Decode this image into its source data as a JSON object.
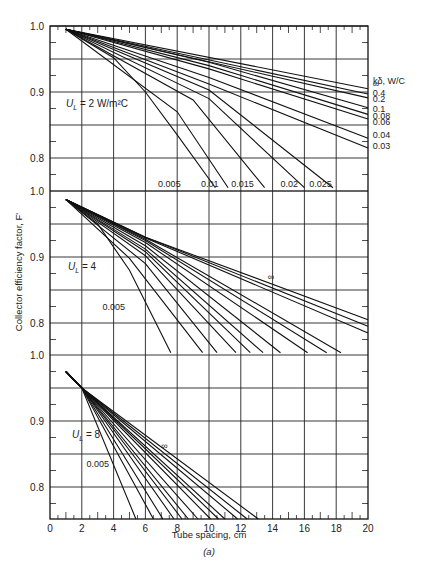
{
  "chart_data": {
    "type": "line",
    "title": "",
    "caption": "(a)",
    "xlabel": "Tube spacing, cm",
    "ylabel": "Collector efficiency factor, F'",
    "xlim": [
      0,
      20
    ],
    "xticks": [
      0,
      2,
      4,
      6,
      8,
      10,
      12,
      14,
      16,
      18,
      20
    ],
    "grid": true,
    "legend_title": "kδ, W/C",
    "legend_placement": "right of top panel",
    "panels": [
      {
        "label": "U_L = 2 W/m²C",
        "label_main": "U",
        "label_sub": "L",
        "label_rest": " = 2 W/m²C",
        "ylim": [
          0.75,
          1.0
        ],
        "yticks": [
          1.0,
          0.9,
          0.8
        ],
        "ytick_labels": [
          "1.0",
          "0.9",
          "0.8"
        ],
        "series": [
          {
            "name": "∞",
            "points": [
              [
                1,
                0.995
              ],
              [
                20,
                0.905
              ]
            ]
          },
          {
            "name": "0.4",
            "points": [
              [
                1,
                0.995
              ],
              [
                20,
                0.897
              ]
            ]
          },
          {
            "name": "0.2",
            "points": [
              [
                1,
                0.995
              ],
              [
                20,
                0.891
              ]
            ]
          },
          {
            "name": "0.1",
            "points": [
              [
                1,
                0.995
              ],
              [
                10,
                0.945
              ],
              [
                20,
                0.876
              ]
            ]
          },
          {
            "name": "0.08",
            "points": [
              [
                1,
                0.995
              ],
              [
                10,
                0.94
              ],
              [
                20,
                0.866
              ]
            ]
          },
          {
            "name": "0.06",
            "points": [
              [
                1,
                0.995
              ],
              [
                10,
                0.935
              ],
              [
                20,
                0.859
              ]
            ]
          },
          {
            "name": "0.04",
            "points": [
              [
                1,
                0.995
              ],
              [
                10,
                0.922
              ],
              [
                20,
                0.83
              ]
            ]
          },
          {
            "name": "0.03",
            "points": [
              [
                1,
                0.995
              ],
              [
                10,
                0.912
              ],
              [
                20,
                0.815
              ]
            ]
          },
          {
            "name": "0.025",
            "points": [
              [
                1,
                0.995
              ],
              [
                10,
                0.903
              ],
              [
                17.8,
                0.755
              ]
            ]
          },
          {
            "name": "0.02",
            "points": [
              [
                1,
                0.995
              ],
              [
                10,
                0.89
              ],
              [
                16.0,
                0.755
              ]
            ]
          },
          {
            "name": "0.015",
            "points": [
              [
                1,
                0.995
              ],
              [
                9,
                0.888
              ],
              [
                13.5,
                0.755
              ]
            ]
          },
          {
            "name": "0.01",
            "points": [
              [
                1,
                0.995
              ],
              [
                8,
                0.87
              ],
              [
                11.2,
                0.755
              ]
            ]
          },
          {
            "name": "0.005",
            "points": [
              [
                1,
                0.995
              ],
              [
                4,
                0.952
              ],
              [
                6,
                0.9
              ],
              [
                8,
                0.835
              ],
              [
                10.4,
                0.755
              ]
            ]
          }
        ],
        "curve_labels": [
          {
            "text": "∞",
            "x": 20.3,
            "y": 0.912
          },
          {
            "text": "0.4",
            "x": 20.3,
            "y": 0.898
          },
          {
            "text": "0.2",
            "x": 20.3,
            "y": 0.889
          },
          {
            "text": "0.1",
            "x": 20.3,
            "y": 0.874
          },
          {
            "text": "0.08",
            "x": 20.3,
            "y": 0.864
          },
          {
            "text": "0.06",
            "x": 20.3,
            "y": 0.854
          },
          {
            "text": "0.04",
            "x": 20.3,
            "y": 0.835
          },
          {
            "text": "0.03",
            "x": 20.3,
            "y": 0.818
          },
          {
            "text": "0.025",
            "x": 16.3,
            "y": 0.76
          },
          {
            "text": "0.02",
            "x": 14.5,
            "y": 0.76
          },
          {
            "text": "0.015",
            "x": 11.4,
            "y": 0.76
          },
          {
            "text": "0.01",
            "x": 9.5,
            "y": 0.76
          },
          {
            "text": "0.005",
            "x": 6.8,
            "y": 0.76
          }
        ]
      },
      {
        "label": "U_L = 4",
        "label_main": "U",
        "label_sub": "L",
        "label_rest": " = 4",
        "ylim": [
          0.75,
          1.0
        ],
        "yticks": [
          1.0,
          0.9,
          0.8
        ],
        "ytick_labels": [
          "1.0",
          "0.9",
          "0.8"
        ],
        "series": [
          {
            "name": "∞",
            "points": [
              [
                1,
                0.987
              ],
              [
                6,
                0.93
              ],
              [
                20,
                0.805
              ]
            ]
          },
          {
            "name": "0.4",
            "points": [
              [
                1,
                0.987
              ],
              [
                6,
                0.93
              ],
              [
                20,
                0.795
              ]
            ]
          },
          {
            "name": "0.2",
            "points": [
              [
                1,
                0.987
              ],
              [
                6,
                0.929
              ],
              [
                20,
                0.785
              ]
            ]
          },
          {
            "name": "0.1",
            "points": [
              [
                1,
                0.987
              ],
              [
                6,
                0.927
              ],
              [
                18.3,
                0.755
              ]
            ]
          },
          {
            "name": "0.08",
            "points": [
              [
                1,
                0.987
              ],
              [
                6,
                0.925
              ],
              [
                17.4,
                0.755
              ]
            ]
          },
          {
            "name": "0.06",
            "points": [
              [
                1,
                0.987
              ],
              [
                6,
                0.922
              ],
              [
                16.2,
                0.755
              ]
            ]
          },
          {
            "name": "0.04",
            "points": [
              [
                1,
                0.987
              ],
              [
                6,
                0.917
              ],
              [
                14.5,
                0.755
              ]
            ]
          },
          {
            "name": "0.03",
            "points": [
              [
                1,
                0.987
              ],
              [
                6,
                0.912
              ],
              [
                13.4,
                0.755
              ]
            ]
          },
          {
            "name": "0.025",
            "points": [
              [
                1,
                0.987
              ],
              [
                6,
                0.908
              ],
              [
                12.6,
                0.755
              ]
            ]
          },
          {
            "name": "0.02",
            "points": [
              [
                1,
                0.987
              ],
              [
                6,
                0.902
              ],
              [
                11.7,
                0.755
              ]
            ]
          },
          {
            "name": "0.015",
            "points": [
              [
                1,
                0.987
              ],
              [
                6,
                0.89
              ],
              [
                10.5,
                0.755
              ]
            ]
          },
          {
            "name": "0.01",
            "points": [
              [
                1,
                0.987
              ],
              [
                5,
                0.898
              ],
              [
                9.6,
                0.755
              ]
            ]
          },
          {
            "name": "0.005",
            "points": [
              [
                1,
                0.987
              ],
              [
                3,
                0.95
              ],
              [
                5,
                0.88
              ],
              [
                7.6,
                0.755
              ]
            ]
          }
        ],
        "curve_labels": [
          {
            "text": "∞",
            "x": 13.7,
            "y": 0.87
          },
          {
            "text": "0.005",
            "x": 3.3,
            "y": 0.825
          }
        ]
      },
      {
        "label": "U_L = 8",
        "label_main": "U",
        "label_sub": "L",
        "label_rest": " = 8",
        "ylim": [
          0.75,
          1.0
        ],
        "yticks": [
          1.0,
          0.9,
          0.8
        ],
        "ytick_labels": [
          "1.0",
          "0.9",
          "0.8"
        ],
        "series": [
          {
            "name": "∞",
            "points": [
              [
                1,
                0.975
              ],
              [
                2,
                0.95
              ],
              [
                13.1,
                0.75
              ]
            ]
          },
          {
            "name": "0.4",
            "points": [
              [
                1,
                0.975
              ],
              [
                2,
                0.95
              ],
              [
                12.4,
                0.75
              ]
            ]
          },
          {
            "name": "0.2",
            "points": [
              [
                1,
                0.975
              ],
              [
                2,
                0.95
              ],
              [
                11.8,
                0.75
              ]
            ]
          },
          {
            "name": "0.1",
            "points": [
              [
                1,
                0.975
              ],
              [
                2,
                0.95
              ],
              [
                11.0,
                0.75
              ]
            ]
          },
          {
            "name": "0.08",
            "points": [
              [
                1,
                0.975
              ],
              [
                2,
                0.95
              ],
              [
                10.6,
                0.75
              ]
            ]
          },
          {
            "name": "0.06",
            "points": [
              [
                1,
                0.975
              ],
              [
                2,
                0.95
              ],
              [
                10.1,
                0.75
              ]
            ]
          },
          {
            "name": "0.04",
            "points": [
              [
                1,
                0.975
              ],
              [
                2,
                0.95
              ],
              [
                9.3,
                0.75
              ]
            ]
          },
          {
            "name": "0.03",
            "points": [
              [
                1,
                0.975
              ],
              [
                2,
                0.95
              ],
              [
                8.7,
                0.75
              ]
            ]
          },
          {
            "name": "0.025",
            "points": [
              [
                1,
                0.975
              ],
              [
                2,
                0.95
              ],
              [
                8.3,
                0.75
              ]
            ]
          },
          {
            "name": "0.02",
            "points": [
              [
                1,
                0.975
              ],
              [
                2,
                0.95
              ],
              [
                7.8,
                0.75
              ]
            ]
          },
          {
            "name": "0.015",
            "points": [
              [
                1,
                0.975
              ],
              [
                2,
                0.95
              ],
              [
                7.1,
                0.75
              ]
            ]
          },
          {
            "name": "0.01",
            "points": [
              [
                1,
                0.975
              ],
              [
                2,
                0.95
              ],
              [
                6.5,
                0.75
              ]
            ]
          },
          {
            "name": "0.005",
            "points": [
              [
                1,
                0.975
              ],
              [
                2,
                0.95
              ],
              [
                5.4,
                0.75
              ]
            ]
          }
        ],
        "curve_labels": [
          {
            "text": "∞",
            "x": 7.0,
            "y": 0.862
          },
          {
            "text": "0.005",
            "x": 2.3,
            "y": 0.835
          }
        ]
      }
    ]
  }
}
